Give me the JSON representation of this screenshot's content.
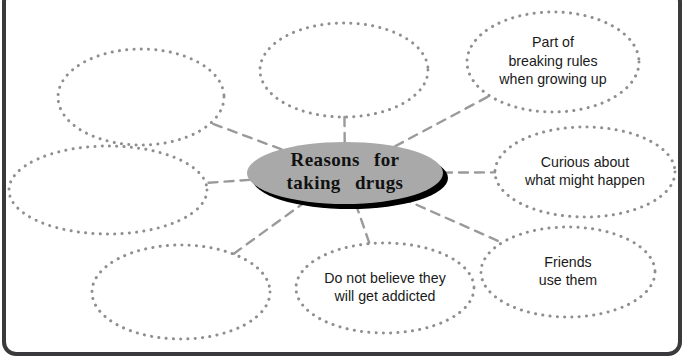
{
  "diagram": {
    "type": "mind-map",
    "title": "Reasons for taking drugs",
    "center": {
      "label_line1": "Reasons  for",
      "label_line2": "taking  drugs",
      "fill_color": "#a9a9a9",
      "shadow_color": "#000000",
      "cx": 345,
      "cy": 173,
      "rx": 98,
      "ry": 31
    },
    "connector": {
      "color": "#9a9a9a",
      "style": "dashed"
    },
    "bubble_border_color": "#8f8f8f",
    "branches": [
      {
        "name": "branch-top-left-empty",
        "lines": [],
        "empty": true,
        "cx": 141,
        "cy": 97,
        "rx": 83,
        "ry": 48
      },
      {
        "name": "branch-top-center-empty",
        "lines": [],
        "empty": true,
        "cx": 344,
        "cy": 70,
        "rx": 84,
        "ry": 47
      },
      {
        "name": "branch-breaking-rules",
        "lines": [
          "Part of",
          "breaking rules",
          "when growing up"
        ],
        "empty": false,
        "cx": 553,
        "cy": 62,
        "rx": 86,
        "ry": 50
      },
      {
        "name": "branch-curious",
        "lines": [
          "Curious about",
          "what might happen"
        ],
        "empty": false,
        "cx": 585,
        "cy": 172,
        "rx": 90,
        "ry": 45
      },
      {
        "name": "branch-friends-use-them",
        "lines": [
          "Friends",
          "use them"
        ],
        "empty": false,
        "cx": 568,
        "cy": 272,
        "rx": 87,
        "ry": 45
      },
      {
        "name": "branch-not-addicted",
        "lines": [
          "Do not believe they",
          "will get addicted"
        ],
        "empty": false,
        "cx": 385,
        "cy": 288,
        "rx": 89,
        "ry": 45
      },
      {
        "name": "branch-bottom-left-empty",
        "lines": [],
        "empty": true,
        "cx": 181,
        "cy": 292,
        "rx": 89,
        "ry": 47
      },
      {
        "name": "branch-left-empty",
        "lines": [],
        "empty": true,
        "cx": 108,
        "cy": 190,
        "rx": 99,
        "ry": 44
      }
    ]
  }
}
